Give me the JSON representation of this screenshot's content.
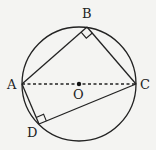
{
  "diagram": {
    "type": "circle-inscribed-quadrilateral",
    "background": "#f4f4f2",
    "stroke_color": "#222222",
    "circle": {
      "center": "O",
      "cx": 79,
      "cy": 84,
      "r": 57
    },
    "points": {
      "A": {
        "label": "A",
        "x": 22,
        "y": 84
      },
      "B": {
        "label": "B",
        "x": 87,
        "y": 27
      },
      "C": {
        "label": "C",
        "x": 136,
        "y": 84
      },
      "D": {
        "label": "D",
        "x": 39,
        "y": 124
      },
      "O": {
        "label": "O",
        "x": 79,
        "y": 84
      }
    },
    "segments": [
      {
        "from": "A",
        "to": "B",
        "style": "solid"
      },
      {
        "from": "B",
        "to": "C",
        "style": "solid"
      },
      {
        "from": "C",
        "to": "D",
        "style": "solid"
      },
      {
        "from": "D",
        "to": "A",
        "style": "solid"
      },
      {
        "from": "A",
        "to": "C",
        "style": "dashed",
        "note": "diameter through O"
      }
    ],
    "right_angles": [
      "B",
      "D"
    ]
  }
}
